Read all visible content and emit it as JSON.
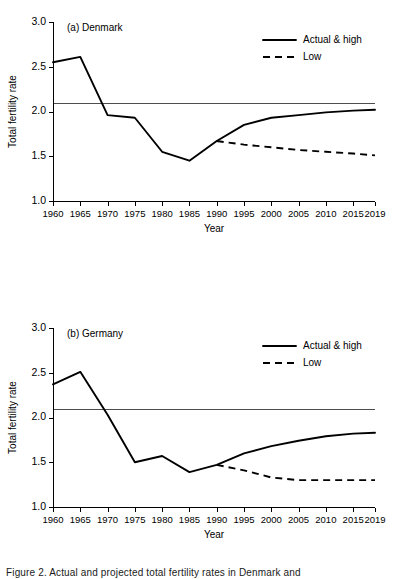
{
  "figure": {
    "caption": "Figure 2. Actual and projected total fertility rates in Denmark and",
    "background_color": "#ffffff",
    "line_color": "#000000",
    "replacement_line_color": "#4d4d4d"
  },
  "axis": {
    "ylabel": "Total fertility rate",
    "xlabel": "Year",
    "yticks": [
      "1.0",
      "1.5",
      "2.0",
      "2.5",
      "3.0"
    ],
    "ytick_values": [
      1.0,
      1.5,
      2.0,
      2.5,
      3.0
    ],
    "xticks": [
      "1960",
      "1965",
      "1970",
      "1975",
      "1980",
      "1985",
      "1990",
      "1995",
      "2000",
      "2005",
      "2010",
      "2015",
      "2019"
    ],
    "xtick_values": [
      1960,
      1965,
      1970,
      1975,
      1980,
      1985,
      1990,
      1995,
      2000,
      2005,
      2010,
      2015,
      2019
    ],
    "ylim": [
      1.0,
      3.0
    ],
    "xlim": [
      1960,
      2019
    ]
  },
  "legend": {
    "position": "top-right",
    "entries": [
      {
        "label": "Actual & high",
        "style": "solid"
      },
      {
        "label": "Low",
        "style": "dashed"
      }
    ]
  },
  "chart_data": [
    {
      "type": "line",
      "title": "(a) Denmark",
      "panel": "a",
      "xlabel": "Year",
      "ylabel": "Total fertility rate",
      "xlim": [
        1960,
        2019
      ],
      "ylim": [
        1.0,
        3.0
      ],
      "grid": false,
      "legend_position": "top-right",
      "annotations": [
        {
          "name": "replacement-level-line",
          "type": "hline",
          "y": 2.1
        }
      ],
      "series": [
        {
          "name": "Actual & high",
          "style": "solid",
          "x": [
            1960,
            1965,
            1970,
            1975,
            1980,
            1985,
            1990,
            1995,
            2000,
            2005,
            2010,
            2015,
            2019
          ],
          "values": [
            2.55,
            2.61,
            1.96,
            1.93,
            1.55,
            1.45,
            1.67,
            1.85,
            1.93,
            1.96,
            1.99,
            2.01,
            2.02
          ]
        },
        {
          "name": "Low",
          "style": "dashed",
          "x": [
            1990,
            1995,
            2000,
            2005,
            2010,
            2015,
            2019
          ],
          "values": [
            1.67,
            1.63,
            1.6,
            1.57,
            1.55,
            1.53,
            1.51
          ]
        }
      ]
    },
    {
      "type": "line",
      "title": "(b) Germany",
      "panel": "b",
      "xlabel": "Year",
      "ylabel": "Total fertility rate",
      "xlim": [
        1960,
        2019
      ],
      "ylim": [
        1.0,
        3.0
      ],
      "grid": false,
      "legend_position": "top-right",
      "annotations": [
        {
          "name": "replacement-level-line",
          "type": "hline",
          "y": 2.1
        }
      ],
      "series": [
        {
          "name": "Actual & high",
          "style": "solid",
          "x": [
            1960,
            1965,
            1970,
            1975,
            1980,
            1985,
            1990,
            1995,
            2000,
            2005,
            2010,
            2015,
            2019
          ],
          "values": [
            2.37,
            2.51,
            2.03,
            1.5,
            1.57,
            1.39,
            1.47,
            1.6,
            1.68,
            1.74,
            1.79,
            1.82,
            1.83
          ]
        },
        {
          "name": "Low",
          "style": "dashed",
          "x": [
            1990,
            1995,
            2000,
            2005,
            2010,
            2015,
            2019
          ],
          "values": [
            1.47,
            1.41,
            1.33,
            1.3,
            1.3,
            1.3,
            1.3
          ]
        }
      ]
    }
  ]
}
